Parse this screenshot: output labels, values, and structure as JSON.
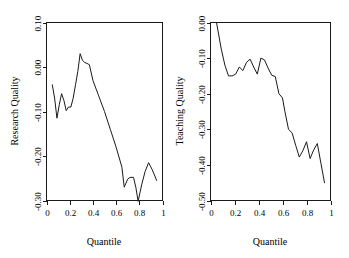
{
  "figure": {
    "background_color": "#ffffff",
    "line_color": "#1a1a1a",
    "panel_count": 2
  },
  "chart_data": [
    {
      "type": "line",
      "title": "",
      "xlabel": "Quantile",
      "ylabel": "Research Quality",
      "xlim": [
        0,
        1
      ],
      "ylim": [
        -0.3,
        0.1
      ],
      "grid": false,
      "legend": null,
      "xticks": [
        0,
        0.2,
        0.4,
        0.6,
        0.8,
        1
      ],
      "xticklabels": [
        "0",
        "0.2",
        "0.4",
        "0.6",
        "0.8",
        "1"
      ],
      "yticks": [
        0.1,
        0.0,
        -0.1,
        -0.2,
        -0.3
      ],
      "yticklabels": [
        "0.10",
        "0.00",
        "-0.10",
        "-0.20",
        "-0.30"
      ],
      "x": [
        0.05,
        0.07,
        0.09,
        0.11,
        0.13,
        0.15,
        0.17,
        0.19,
        0.21,
        0.23,
        0.25,
        0.27,
        0.29,
        0.31,
        0.33,
        0.35,
        0.37,
        0.4,
        0.45,
        0.5,
        0.55,
        0.6,
        0.65,
        0.67,
        0.7,
        0.72,
        0.75,
        0.77,
        0.79,
        0.82,
        0.85,
        0.88,
        0.91,
        0.95
      ],
      "y": [
        -0.04,
        -0.07,
        -0.115,
        -0.085,
        -0.06,
        -0.075,
        -0.098,
        -0.09,
        -0.09,
        -0.07,
        -0.04,
        -0.01,
        0.03,
        0.015,
        0.01,
        0.008,
        0.005,
        -0.03,
        -0.065,
        -0.1,
        -0.14,
        -0.18,
        -0.225,
        -0.27,
        -0.252,
        -0.248,
        -0.248,
        -0.27,
        -0.302,
        -0.265,
        -0.235,
        -0.215,
        -0.23,
        -0.255
      ]
    },
    {
      "type": "line",
      "title": "",
      "xlabel": "Quantile",
      "ylabel": "Teaching Quality",
      "xlim": [
        0,
        1
      ],
      "ylim": [
        -0.5,
        0.0
      ],
      "grid": false,
      "legend": null,
      "xticks": [
        0,
        0.2,
        0.4,
        0.6,
        0.8,
        1
      ],
      "xticklabels": [
        "0",
        "0.2",
        "0.4",
        "0.6",
        "0.8",
        "1"
      ],
      "yticks": [
        0.0,
        -0.1,
        -0.2,
        -0.3,
        -0.4,
        -0.5
      ],
      "yticklabels": [
        "0.00",
        "-0.10",
        "-0.20",
        "-0.30",
        "-0.40",
        "-0.50"
      ],
      "x": [
        0.05,
        0.09,
        0.12,
        0.15,
        0.18,
        0.21,
        0.24,
        0.27,
        0.3,
        0.33,
        0.36,
        0.39,
        0.42,
        0.45,
        0.48,
        0.51,
        0.54,
        0.57,
        0.6,
        0.62,
        0.65,
        0.68,
        0.71,
        0.74,
        0.77,
        0.8,
        0.83,
        0.86,
        0.89,
        0.92,
        0.95
      ],
      "y": [
        0.0,
        -0.075,
        -0.12,
        -0.15,
        -0.15,
        -0.145,
        -0.125,
        -0.135,
        -0.112,
        -0.103,
        -0.125,
        -0.145,
        -0.1,
        -0.105,
        -0.128,
        -0.148,
        -0.152,
        -0.2,
        -0.212,
        -0.25,
        -0.3,
        -0.31,
        -0.345,
        -0.378,
        -0.36,
        -0.335,
        -0.382,
        -0.358,
        -0.34,
        -0.395,
        -0.45
      ]
    }
  ]
}
